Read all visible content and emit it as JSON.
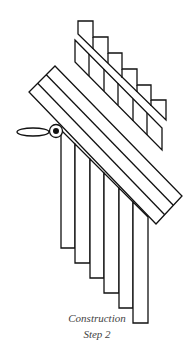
{
  "caption": {
    "line1": "Construction",
    "line2": "Step 2"
  },
  "colors": {
    "stroke": "#111111",
    "background": "#ffffff",
    "caption": "#444444"
  }
}
